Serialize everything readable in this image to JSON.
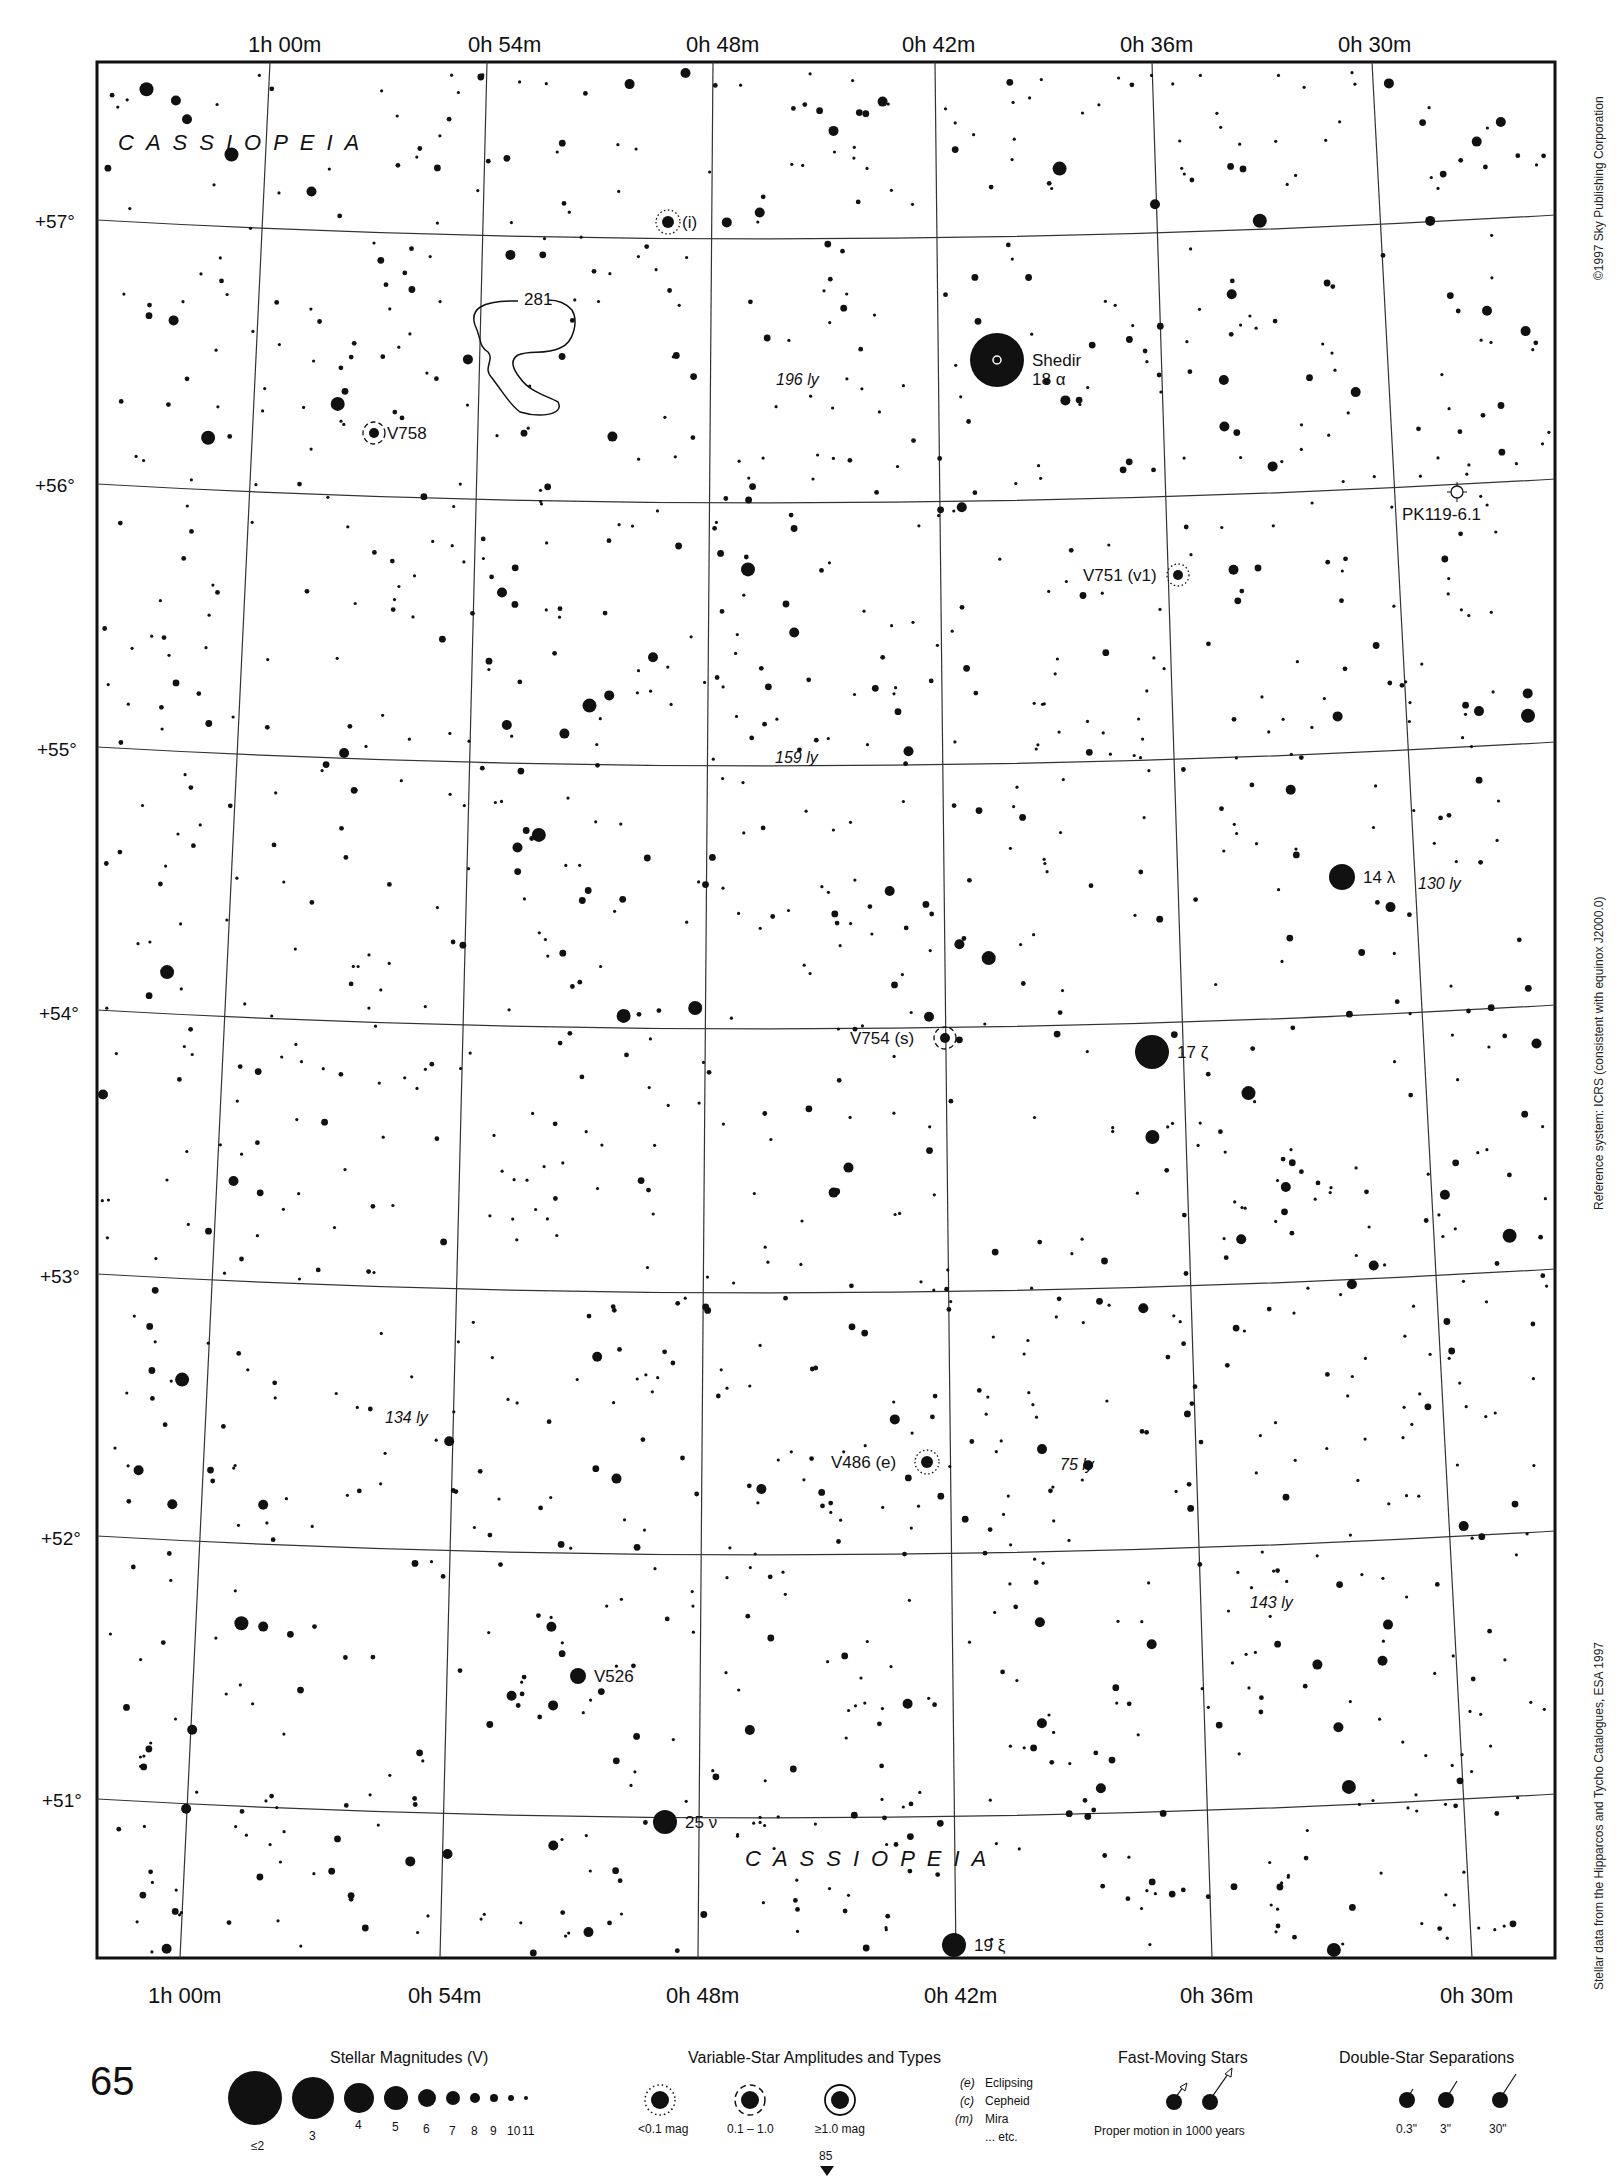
{
  "page": {
    "number": "65",
    "next_page_ref": "85"
  },
  "colors": {
    "ink": "#111111",
    "background": "#ffffff",
    "grid": "#333333"
  },
  "axes": {
    "ra_top": [
      "1h 00m",
      "0h 54m",
      "0h 48m",
      "0h 42m",
      "0h 36m",
      "0h 30m"
    ],
    "ra_bottom": [
      "1h 00m",
      "0h 54m",
      "0h 48m",
      "0h 42m",
      "0h 36m",
      "0h 30m"
    ],
    "dec": [
      "+57°",
      "+56°",
      "+55°",
      "+54°",
      "+53°",
      "+52°",
      "+51°"
    ]
  },
  "side_notes": {
    "copyright": "©1997 Sky Publishing Corporation",
    "reference": "Reference system: ICRS (consistent with equinox J2000.0)",
    "data_source": "Stellar data from the Hipparcos and Tycho Catalogues, ESA 1997"
  },
  "constellations": [
    {
      "name": "CASSIOPEIA",
      "x": 118,
      "y": 150
    },
    {
      "name": "CASSIOPEIA",
      "x": 745,
      "y": 1866
    }
  ],
  "labeled_objects": [
    {
      "label": "Shedir",
      "sub": "18 α",
      "x": 997,
      "y": 360,
      "r": 27,
      "type": "star"
    },
    {
      "label": "17 ζ",
      "x": 1152,
      "y": 1052,
      "r": 17,
      "type": "star"
    },
    {
      "label": "14 λ",
      "x": 1342,
      "y": 877,
      "r": 13,
      "type": "star"
    },
    {
      "label": "25 ν",
      "x": 665,
      "y": 1822,
      "r": 12,
      "type": "star"
    },
    {
      "label": "19 ξ",
      "x": 954,
      "y": 1945,
      "r": 12,
      "type": "star"
    },
    {
      "label": "V758",
      "x": 374,
      "y": 433,
      "r": 5,
      "type": "variable-cepheid"
    },
    {
      "label": "V751 (v1)",
      "x": 1178,
      "y": 575,
      "r": 5,
      "type": "variable-small"
    },
    {
      "label": "V754 (s)",
      "x": 945,
      "y": 1038,
      "r": 5,
      "type": "variable-cepheid"
    },
    {
      "label": "V486 (e)",
      "x": 927,
      "y": 1462,
      "r": 6,
      "type": "variable-small"
    },
    {
      "label": "V526",
      "x": 578,
      "y": 1676,
      "r": 8,
      "type": "star"
    },
    {
      "label": "(i)",
      "x": 668,
      "y": 222,
      "r": 6,
      "type": "variable-small"
    },
    {
      "label": "PK119-6.1",
      "x": 1457,
      "y": 492,
      "r": 6,
      "type": "planetary-nebula"
    },
    {
      "label": "281",
      "x": 534,
      "y": 300,
      "r": 0,
      "type": "nebula"
    }
  ],
  "distance_labels": [
    {
      "text": "196 ly",
      "x": 776,
      "y": 385
    },
    {
      "text": "159 ly",
      "x": 775,
      "y": 763
    },
    {
      "text": "130 ly",
      "x": 1418,
      "y": 889
    },
    {
      "text": "134 ly",
      "x": 385,
      "y": 1423
    },
    {
      "text": "75 ly",
      "x": 1060,
      "y": 1470
    },
    {
      "text": "143 ly",
      "x": 1250,
      "y": 1608
    }
  ],
  "legend": {
    "magnitudes": {
      "title": "Stellar Magnitudes (V)",
      "items": [
        {
          "label": "≤2",
          "r": 27
        },
        {
          "label": "3",
          "r": 21
        },
        {
          "label": "4",
          "r": 15
        },
        {
          "label": "5",
          "r": 12
        },
        {
          "label": "6",
          "r": 9
        },
        {
          "label": "7",
          "r": 7
        },
        {
          "label": "8",
          "r": 5
        },
        {
          "label": "9",
          "r": 4
        },
        {
          "label": "10",
          "r": 3
        },
        {
          "label": "11",
          "r": 2
        }
      ]
    },
    "variables": {
      "title": "Variable-Star Amplitudes and Types",
      "amplitudes": [
        "<0.1 mag",
        "0.1 – 1.0",
        "≥1.0 mag"
      ],
      "types": [
        {
          "code": "(e)",
          "name": "Eclipsing"
        },
        {
          "code": "(c)",
          "name": "Cepheid"
        },
        {
          "code": "(m)",
          "name": "Mira"
        },
        {
          "code": "",
          "name": "... etc."
        }
      ]
    },
    "fast_moving": {
      "title": "Fast-Moving Stars",
      "caption": "Proper motion in 1000 years"
    },
    "doubles": {
      "title": "Double-Star Separations",
      "items": [
        "0.3\"",
        "3\"",
        "30\""
      ]
    }
  },
  "chart_data": {
    "type": "star-map",
    "ra_range": [
      "1h 00m",
      "0h 30m"
    ],
    "dec_range": [
      "+51°",
      "+57°"
    ],
    "ra_ticks": [
      "1h 00m",
      "0h 54m",
      "0h 48m",
      "0h 42m",
      "0h 36m",
      "0h 30m"
    ],
    "dec_ticks": [
      "+57°",
      "+56°",
      "+55°",
      "+54°",
      "+53°",
      "+52°",
      "+51°"
    ],
    "grid": true,
    "named_stars": [
      "Shedir 18 α",
      "17 ζ",
      "14 λ",
      "25 ν",
      "19 ξ"
    ],
    "variables": [
      "V758",
      "V751 (v1)",
      "V754 (s)",
      "V486 (e)",
      "V526",
      "(i)"
    ],
    "deep_sky": [
      "281",
      "PK119-6.1"
    ],
    "distances_ly": [
      196,
      159,
      130,
      134,
      75,
      143
    ]
  }
}
